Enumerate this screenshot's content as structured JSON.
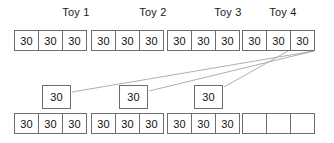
{
  "diagram": {
    "title_labels": [
      {
        "text": "Toy 1",
        "x": 36,
        "y": 6,
        "width": 80
      },
      {
        "text": "Toy 2",
        "x": 113,
        "y": 6,
        "width": 80
      },
      {
        "text": "Toy 3",
        "x": 188,
        "y": 6,
        "width": 80
      },
      {
        "text": "Toy 4",
        "x": 243,
        "y": 6,
        "width": 80
      }
    ],
    "top_row": [
      {
        "name": "toy-1",
        "x": 14,
        "y": 30,
        "cells": [
          "30",
          "30",
          "30"
        ]
      },
      {
        "name": "toy-2",
        "x": 91,
        "y": 30,
        "cells": [
          "30",
          "30",
          "30"
        ]
      },
      {
        "name": "toy-3",
        "x": 167,
        "y": 30,
        "cells": [
          "30",
          "30",
          "30"
        ]
      },
      {
        "name": "toy-4",
        "x": 242,
        "y": 30,
        "cells": [
          "30",
          "30",
          "30"
        ]
      }
    ],
    "middle_boxes": [
      {
        "name": "middle-box-1",
        "x": 42,
        "y": 85,
        "value": "30"
      },
      {
        "name": "middle-box-2",
        "x": 119,
        "y": 85,
        "value": "30"
      },
      {
        "name": "middle-box-3",
        "x": 194,
        "y": 85,
        "value": "30"
      }
    ],
    "bottom_row": [
      {
        "name": "bottom-group-1",
        "x": 14,
        "y": 113,
        "cells": [
          "30",
          "30",
          "30"
        ]
      },
      {
        "name": "bottom-group-2",
        "x": 91,
        "y": 113,
        "cells": [
          "30",
          "30",
          "30"
        ]
      },
      {
        "name": "bottom-group-3",
        "x": 167,
        "y": 113,
        "cells": [
          "30",
          "30",
          "30"
        ]
      },
      {
        "name": "bottom-group-4",
        "x": 242,
        "y": 113,
        "cells": [
          "",
          "",
          ""
        ]
      }
    ],
    "connector_lines": [
      {
        "name": "connector-line-1",
        "x1": 314,
        "y1": 51,
        "x2": 72,
        "y2": 92
      },
      {
        "name": "connector-line-2",
        "x1": 314,
        "y1": 51,
        "x2": 149,
        "y2": 91
      },
      {
        "name": "connector-line-3",
        "x1": 288,
        "y1": 51,
        "x2": 224,
        "y2": 87
      }
    ],
    "colors": {
      "border": "#6e6e6e",
      "connector": "#9a9a9a",
      "text": "#111111",
      "background": "#ffffff"
    }
  }
}
